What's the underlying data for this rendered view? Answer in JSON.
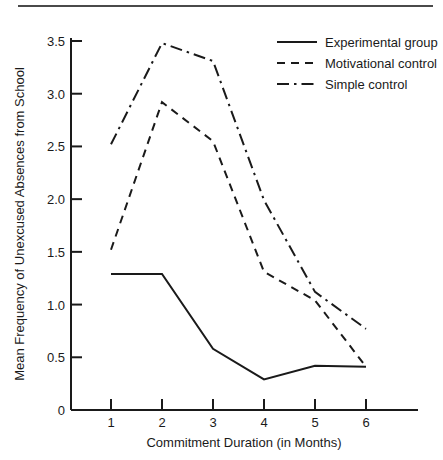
{
  "chart_data": {
    "type": "line",
    "title": "",
    "xlabel": "Commitment Duration (in Months)",
    "ylabel": "Mean Frequency of Unexcused Absences from School",
    "x": [
      1,
      2,
      3,
      4,
      5,
      6
    ],
    "xtick_labels": [
      "1",
      "2",
      "3",
      "4",
      "5",
      "6"
    ],
    "ytick_labels": [
      "0",
      "0.5",
      "1.0",
      "1.5",
      "2.0",
      "2.5",
      "3.0",
      "3.5"
    ],
    "yticks": [
      0,
      0.5,
      1.0,
      1.5,
      2.0,
      2.5,
      3.0,
      3.5
    ],
    "xlim": [
      0.55,
      6.6
    ],
    "ylim": [
      0,
      3.5
    ],
    "grid": false,
    "legend_position": "top-right",
    "series": [
      {
        "name": "Experimental group",
        "style": "solid",
        "values": [
          1.29,
          1.29,
          0.58,
          0.29,
          0.42,
          0.41
        ]
      },
      {
        "name": "Motivational control",
        "style": "dashed",
        "values": [
          1.52,
          2.92,
          2.55,
          1.31,
          1.04,
          0.41
        ]
      },
      {
        "name": "Simple control",
        "style": "dashdot",
        "values": [
          2.52,
          3.48,
          3.31,
          1.99,
          1.12,
          0.77
        ]
      }
    ]
  },
  "legend": {
    "items": [
      {
        "label": "Experimental group",
        "style": "solid"
      },
      {
        "label": "Motivational control",
        "style": "dashed"
      },
      {
        "label": "Simple control",
        "style": "dashdot"
      }
    ]
  },
  "axes": {
    "x_title": "Commitment Duration (in Months)",
    "y_title": "Mean Frequency of Unexcused Absences from School"
  },
  "colors": {
    "line": "#1a1a1a",
    "axis": "#1a1a1a",
    "background": "#ffffff",
    "rule": "#4a4a4a"
  }
}
